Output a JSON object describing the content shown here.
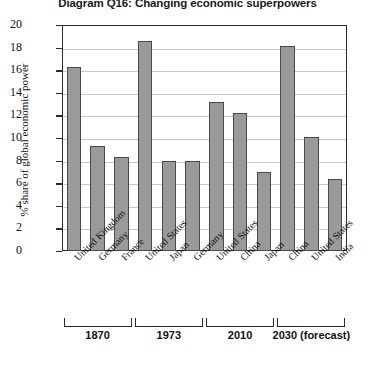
{
  "chart_data": {
    "type": "bar",
    "title": "Diagram Q16: Changing economic superpowers",
    "xlabel": "",
    "ylabel": "% share of global economic power",
    "ylim": [
      0,
      20
    ],
    "ytick_step": 2,
    "grid": true,
    "legend": "none",
    "categories": [
      "United Kingdom",
      "Germany",
      "France",
      "United States",
      "Japan",
      "Germany",
      "United States",
      "China",
      "Japan",
      "China",
      "United States",
      "India"
    ],
    "values": [
      16.3,
      9.3,
      8.3,
      18.6,
      8.0,
      8.0,
      13.2,
      12.2,
      7.0,
      18.1,
      10.1,
      6.4
    ],
    "ytick_labels": [
      "0",
      "2",
      "4",
      "6",
      "8",
      "10",
      "12",
      "14",
      "16",
      "18",
      "20"
    ],
    "groups": [
      {
        "label": "1870",
        "start": 0,
        "end": 2
      },
      {
        "label": "1973",
        "start": 3,
        "end": 5
      },
      {
        "label": "2010",
        "start": 6,
        "end": 8
      },
      {
        "label": "2030 (forecast)",
        "start": 9,
        "end": 11
      }
    ],
    "bar_color": "#9a9a9a",
    "bar_border_color": "#4a4a4a",
    "axis_color": "#2b2b2b",
    "grid_color": "#c9c9c9"
  }
}
